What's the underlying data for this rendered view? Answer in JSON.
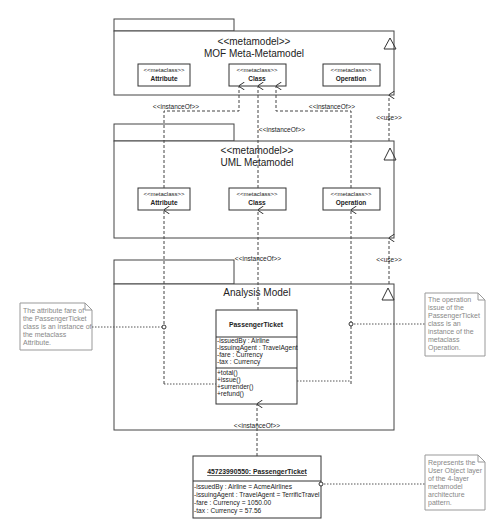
{
  "mof": {
    "stereotype": "<<metamodel>>",
    "title": "MOF Meta-Metamodel",
    "classes": [
      {
        "stereotype": "<<metaclass>>",
        "name": "Attribute"
      },
      {
        "stereotype": "<<metaclass>>",
        "name": "Class"
      },
      {
        "stereotype": "<<metaclass>>",
        "name": "Operation"
      }
    ]
  },
  "uml": {
    "stereotype": "<<metamodel>>",
    "title": "UML Metamodel",
    "classes": [
      {
        "stereotype": "<<metaclass>>",
        "name": "Attribute"
      },
      {
        "stereotype": "<<metaclass>>",
        "name": "Class"
      },
      {
        "stereotype": "<<metaclass>>",
        "name": "Operation"
      }
    ]
  },
  "analysis": {
    "title": "Analysis Model",
    "class": {
      "name": "PassengerTicket",
      "attributes": [
        "-issuedBy : Airline",
        "-issuingAgent : TravelAgent",
        "-fare : Currency",
        "-tax : Currency"
      ],
      "operations": [
        "+total()",
        "+issue()",
        "+surrender()",
        "+refund()"
      ]
    }
  },
  "object": {
    "name": "45723990550: PassengerTicket",
    "attributes": [
      "-issuedBy : Airline = AcmeAirlines",
      "-issuingAgent : TravelAgent = TerrificTravel",
      "-fare : Currency = 1050.00",
      "-tax : Currency = 57.56"
    ]
  },
  "labels": {
    "instance_of": "<<instanceOf>>",
    "use": "<<use>>"
  },
  "notes": {
    "attribute_note": [
      "The attribute fare of",
      "the PassengerTicket",
      "class is an instance of",
      "the metaclass",
      "Attribute."
    ],
    "operation_note": [
      "The operation",
      "issue of the",
      "PassengerTicket",
      "class is an",
      "instance of the",
      "metaclass",
      "Operation."
    ],
    "object_note": [
      "Represents the",
      "User Object layer",
      "of the 4-layer",
      "metamodel",
      "architecture",
      "pattern."
    ]
  }
}
